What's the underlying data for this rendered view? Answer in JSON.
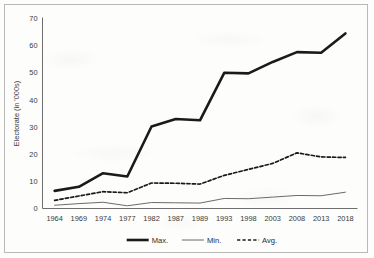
{
  "chart_data": {
    "type": "line",
    "title": "",
    "xlabel": "",
    "ylabel": "Electorate (in '000s)",
    "ylim": [
      0,
      70
    ],
    "yticks": [
      0,
      10,
      20,
      30,
      40,
      50,
      60,
      70
    ],
    "grid": false,
    "legend_position": "bottom",
    "categories": [
      "1964",
      "1969",
      "1974",
      "1977",
      "1982",
      "1987",
      "1989",
      "1993",
      "1998",
      "2003",
      "2008",
      "2013",
      "2018"
    ],
    "series": [
      {
        "name": "Max.",
        "style": "thick-solid",
        "color": "#1a1a1a",
        "values": [
          6.5,
          8.0,
          13.0,
          11.8,
          30.2,
          33.0,
          32.5,
          50.0,
          49.8,
          54.0,
          57.6,
          57.4,
          64.5
        ]
      },
      {
        "name": "Min.",
        "style": "thin-solid",
        "color": "#5a5a5a",
        "values": [
          1.2,
          1.8,
          2.3,
          1.0,
          2.2,
          2.1,
          2.0,
          3.7,
          3.6,
          4.2,
          4.8,
          4.7,
          6.0
        ]
      },
      {
        "name": "Avg.",
        "style": "dashed",
        "color": "#1a1a1a",
        "values": [
          3.0,
          4.6,
          6.2,
          5.8,
          9.4,
          9.3,
          9.0,
          12.2,
          14.4,
          16.6,
          20.5,
          19.0,
          18.8
        ]
      }
    ]
  },
  "legend": {
    "items": [
      {
        "label": "Max."
      },
      {
        "label": "Min."
      },
      {
        "label": "Avg."
      }
    ]
  }
}
